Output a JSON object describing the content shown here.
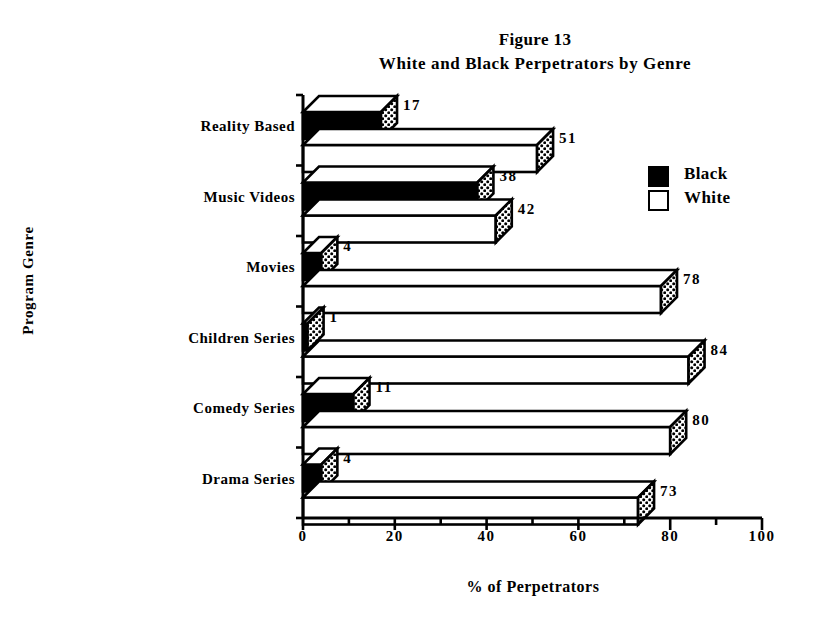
{
  "figure": {
    "title_line1": "Figure 13",
    "title_line2": "White and Black Perpetrators by Genre"
  },
  "legend": {
    "position": "right-upper",
    "entries": [
      {
        "label": "Black",
        "swatch": "black-filled-square",
        "color": "#000000"
      },
      {
        "label": "White",
        "swatch": "white-outlined-square",
        "color": "#ffffff"
      }
    ]
  },
  "axes": {
    "x_title": "% of Perpetrators",
    "y_title": "Program Genre",
    "x_ticks": [
      "0",
      "20",
      "40",
      "60",
      "80",
      "100"
    ]
  },
  "chart_data": {
    "type": "bar",
    "orientation": "horizontal",
    "xlabel": "% of Perpetrators",
    "ylabel": "Program Genre",
    "xlim": [
      0,
      100
    ],
    "xticks": [
      0,
      20,
      40,
      60,
      80,
      100
    ],
    "minor_tick_interval": 10,
    "grid": false,
    "legend_position": "upper right",
    "categories": [
      "Reality Based",
      "Music Videos",
      "Movies",
      "Children Series",
      "Comedy Series",
      "Drama Series"
    ],
    "series": [
      {
        "name": "Black",
        "color": "#000000",
        "values": [
          17,
          38,
          4,
          1,
          11,
          4
        ]
      },
      {
        "name": "White",
        "color": "#ffffff",
        "values": [
          51,
          42,
          78,
          84,
          80,
          73
        ]
      }
    ],
    "data_labels": {
      "Reality Based": {
        "Black": "17",
        "White": "51"
      },
      "Music Videos": {
        "Black": "38",
        "White": "42"
      },
      "Movies": {
        "Black": "4",
        "White": "78"
      },
      "Children Series": {
        "Black": "1",
        "White": "84"
      },
      "Comedy Series": {
        "Black": "11",
        "White": "80"
      },
      "Drama Series": {
        "Black": "4",
        "White": "73"
      }
    }
  }
}
